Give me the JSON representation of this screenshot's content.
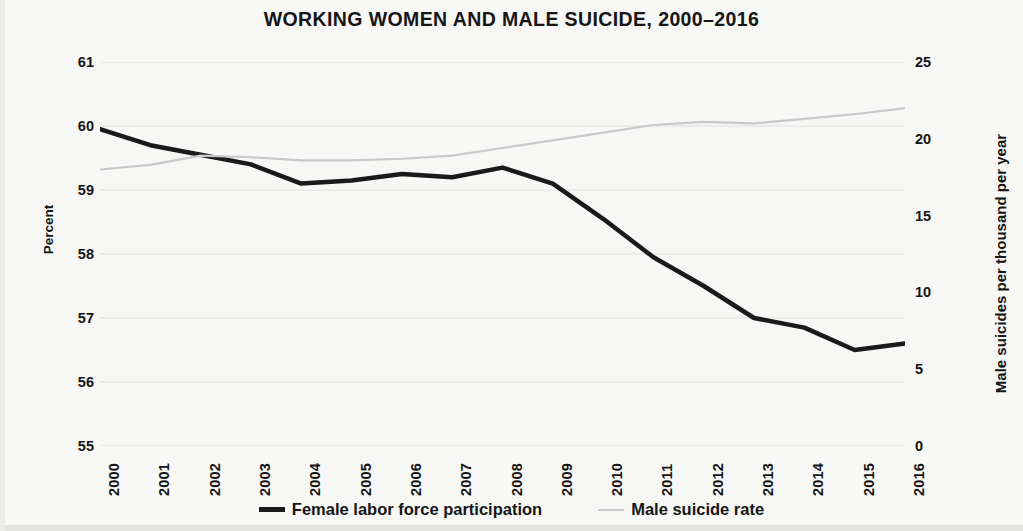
{
  "chart_data": {
    "type": "line",
    "title": "WORKING WOMEN AND MALE SUICIDE, 2000–2016",
    "xlabel": "",
    "ylabel": "Percent",
    "y2label": "Male suicides per thousand per year",
    "grid": true,
    "legend_position": "bottom",
    "x": [
      2000,
      2001,
      2002,
      2003,
      2004,
      2005,
      2006,
      2007,
      2008,
      2009,
      2010,
      2011,
      2012,
      2013,
      2014,
      2015,
      2016
    ],
    "categories": [
      "2000",
      "2001",
      "2002",
      "2003",
      "2004",
      "2005",
      "2006",
      "2007",
      "2008",
      "2009",
      "2010",
      "2011",
      "2012",
      "2013",
      "2014",
      "2015",
      "2016"
    ],
    "ylim": [
      55,
      61
    ],
    "yticks": [
      55,
      56,
      57,
      58,
      59,
      60,
      61
    ],
    "ytick_labels": [
      "55",
      "56",
      "57",
      "58",
      "59",
      "60",
      "61"
    ],
    "y2lim": [
      0,
      25
    ],
    "y2ticks": [
      0,
      5,
      10,
      15,
      20,
      25
    ],
    "y2tick_labels": [
      "0",
      "5",
      "10",
      "15",
      "20",
      "25"
    ],
    "series": [
      {
        "name": "Female labor force participation",
        "axis": "left",
        "color": "#1a1a1a",
        "width": 4.5,
        "values": [
          59.95,
          59.7,
          59.55,
          59.4,
          59.1,
          59.15,
          59.25,
          59.2,
          59.35,
          59.1,
          58.55,
          57.95,
          57.5,
          57.0,
          56.85,
          56.5,
          56.6
        ]
      },
      {
        "name": "Male suicide rate",
        "axis": "right",
        "color": "#c9c9c9",
        "width": 2.2,
        "values": [
          18.0,
          18.3,
          18.9,
          18.8,
          18.6,
          18.6,
          18.7,
          18.9,
          19.4,
          19.9,
          20.4,
          20.9,
          21.1,
          21.0,
          21.3,
          21.6,
          22.0
        ]
      }
    ]
  },
  "legend": {
    "items": [
      {
        "label": "Female labor force participation",
        "swatch": "thick-black-line"
      },
      {
        "label": "Male suicide rate",
        "swatch": "thin-gray-line"
      }
    ]
  },
  "colors": {
    "background": "#f7f7f5",
    "series_black": "#1a1a1a",
    "series_gray": "#c9c9c9",
    "grid": "#e0e0de",
    "text": "#141414"
  }
}
